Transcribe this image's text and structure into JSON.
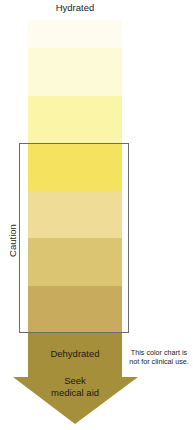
{
  "title": "Hydrated",
  "bands": [
    {
      "level": 1,
      "color": "#fefcee",
      "top": 20,
      "height": 28
    },
    {
      "level": 2,
      "color": "#fdfbd7",
      "top": 48,
      "height": 48
    },
    {
      "level": 3,
      "color": "#fbf5a8",
      "top": 96,
      "height": 47
    },
    {
      "level": 4,
      "color": "#f5e25e",
      "top": 143,
      "height": 48
    },
    {
      "level": 5,
      "color": "#eedc97",
      "top": 191,
      "height": 47
    },
    {
      "level": 6,
      "color": "#dcc572",
      "top": 238,
      "height": 48
    },
    {
      "level": 7,
      "color": "#c8ab5c",
      "top": 286,
      "height": 47
    }
  ],
  "bracket_label": "Caution",
  "arrow": {
    "color": "#a68f3a",
    "label_top": "Dehydrated",
    "label_bottom_line1": "Seek",
    "label_bottom_line2": "medical aid"
  },
  "note_line1": "This color chart is",
  "note_line2": "not for clinical use."
}
